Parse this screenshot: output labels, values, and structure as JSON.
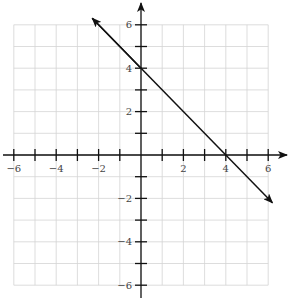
{
  "chart_data": {
    "type": "line",
    "title": "",
    "xlabel": "",
    "ylabel": "",
    "xlim": [
      -6,
      6
    ],
    "ylim": [
      -6,
      6
    ],
    "grid": true,
    "x_ticks": [
      -6,
      -5,
      -4,
      -3,
      -2,
      -1,
      1,
      2,
      3,
      4,
      5,
      6
    ],
    "y_ticks": [
      -6,
      -5,
      -4,
      -3,
      -2,
      -1,
      1,
      2,
      3,
      4,
      5,
      6
    ],
    "x_tick_labels": [
      "−6",
      "−4",
      "−2",
      "2",
      "4",
      "6"
    ],
    "x_tick_label_values": [
      -6,
      -4,
      -2,
      2,
      4,
      6
    ],
    "y_tick_labels": [
      "6",
      "4",
      "2",
      "−2",
      "−4",
      "−6"
    ],
    "y_tick_label_values": [
      6,
      4,
      2,
      -2,
      -4,
      -6
    ],
    "series": [
      {
        "name": "y = -x + 4",
        "equation": "y = -x + 4",
        "slope": -1,
        "y_intercept": 4,
        "x_intercept": 4,
        "x": [
          -2.3,
          0,
          4,
          6.2
        ],
        "y": [
          6.3,
          4,
          0,
          -2.2
        ],
        "arrows": "both",
        "color": "#111111"
      }
    ]
  },
  "colors": {
    "axis": "#111111",
    "grid": "#d4d4d4",
    "line": "#111111",
    "label": "#444444"
  }
}
